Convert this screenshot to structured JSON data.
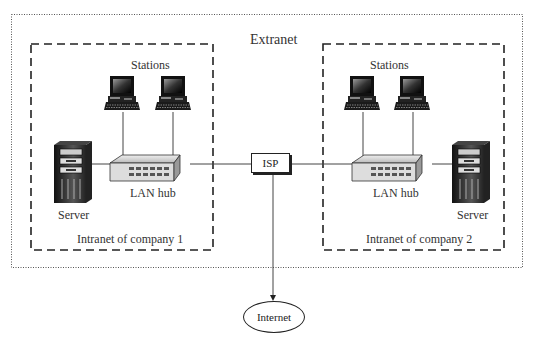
{
  "diagram": {
    "extranet": {
      "label": "Extranet"
    },
    "intranets": [
      {
        "label": "Intranet of company 1",
        "stations_label": "Stations",
        "hub_label": "LAN hub",
        "server_label": "Server"
      },
      {
        "label": "Intranet of company 2",
        "stations_label": "Stations",
        "hub_label": "LAN hub",
        "server_label": "Server"
      }
    ],
    "isp": {
      "label": "ISP"
    },
    "internet": {
      "label": "Internet"
    },
    "icons": [
      "workstation-icon",
      "lan-hub-icon",
      "server-icon"
    ],
    "colors": {
      "line": "#222222",
      "background": "#ffffff",
      "device_dark": "#1a1a1a",
      "device_light": "#d9d9d9"
    }
  }
}
